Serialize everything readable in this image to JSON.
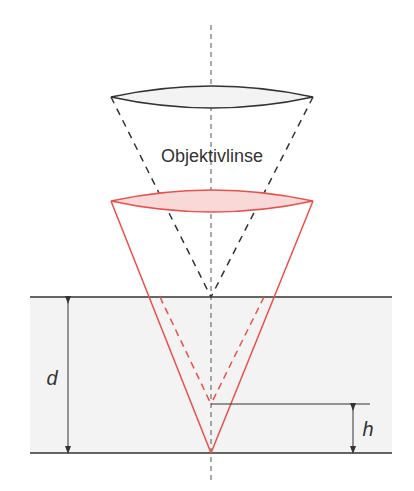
{
  "labels": {
    "lens": "Objektivlinse",
    "depth": "d",
    "height": "h"
  },
  "colors": {
    "outline": "#333333",
    "red": "#e8504a",
    "red_fill": "#f9d9d8",
    "slab_fill": "#f3f3f3",
    "lens_fill": "#f3f3f3"
  }
}
